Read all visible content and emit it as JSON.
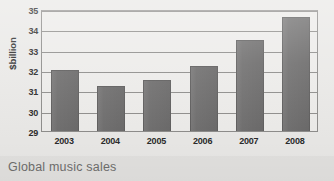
{
  "caption": "Global music sales",
  "colors": {
    "bar": "#706f6f",
    "bar_edge": "#5f5e5e",
    "plot_background": "#edecea",
    "page_background": "#eae9e7",
    "caption_band": "#e3e2e0",
    "gridline": "#8f8e8c",
    "axis_text": "#2b2b2b",
    "caption_text": "#6f6e6d"
  },
  "chart_data": {
    "type": "bar",
    "title": "Global music sales",
    "xlabel": "",
    "ylabel": "$billion",
    "categories": [
      "2003",
      "2004",
      "2005",
      "2006",
      "2007",
      "2008"
    ],
    "values": [
      32.0,
      31.2,
      31.5,
      32.2,
      33.5,
      34.6
    ],
    "ylim": [
      29,
      35
    ],
    "ytick_values": [
      29,
      30,
      31,
      32,
      33,
      34,
      35
    ],
    "ytick_labels": [
      "29",
      "30",
      "31",
      "32",
      "33",
      "34",
      "35"
    ],
    "ytick_step": 1,
    "grid": true,
    "grid_axis": "y",
    "legend": false,
    "legend_position": "none",
    "orientation": "vertical",
    "series": [
      {
        "name": "Global music sales",
        "values": [
          32.0,
          31.2,
          31.5,
          32.2,
          33.5,
          34.6
        ]
      }
    ]
  }
}
